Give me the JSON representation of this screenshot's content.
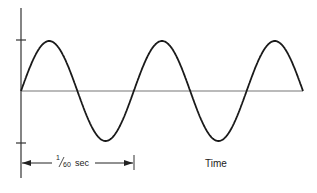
{
  "diagram": {
    "type": "sine-wave",
    "cycles_shown": 2.5,
    "period_label_numerator": "1",
    "period_label_denominator": "60",
    "period_label_unit": "sec",
    "period_label_full": "1/60 sec",
    "x_axis_label": "Time",
    "colors": {
      "wave": "#1a1a1a",
      "baseline": "#777777",
      "axis": "#333333",
      "text": "#222222"
    }
  }
}
